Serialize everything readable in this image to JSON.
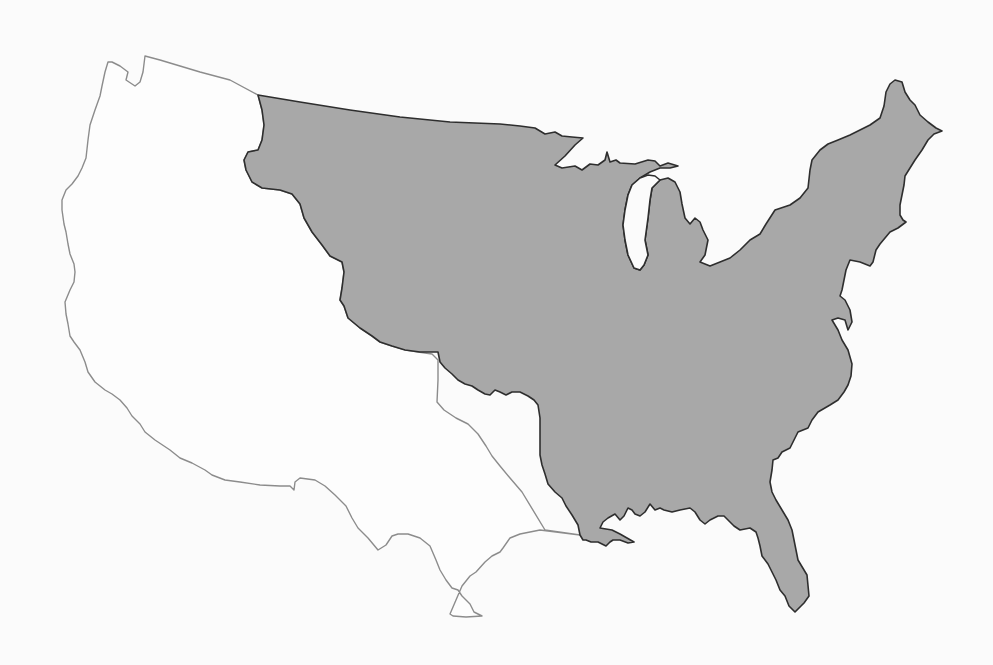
{
  "map": {
    "subject": "Contiguous United States outline",
    "regions": [
      {
        "name": "Western territory (unshaded)",
        "fill": "#fdfdfd",
        "stroke": "#8c8c8c"
      },
      {
        "name": "Eastern territory (shaded)",
        "fill": "#a8a8a8",
        "stroke": "#2e2e2e"
      }
    ],
    "colors": {
      "background": "#fbfbfb",
      "shaded_fill": "#a8a8a8",
      "shaded_outline": "#2e2e2e",
      "unshaded_outline": "#8c8c8c"
    }
  }
}
